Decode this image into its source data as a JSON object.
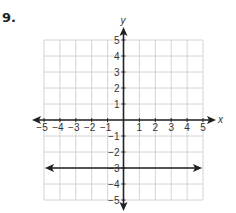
{
  "problem": {
    "number": "9."
  },
  "chart_data": {
    "type": "line",
    "title": "",
    "xlabel": "x",
    "ylabel": "y",
    "xlim": [
      -5,
      5
    ],
    "ylim": [
      -5,
      5
    ],
    "grid": true,
    "x_ticks": [
      "−5",
      "−4",
      "−3",
      "−2",
      "−1",
      "1",
      "2",
      "3",
      "4",
      "5"
    ],
    "y_ticks": [
      "5",
      "4",
      "3",
      "2",
      "1",
      "−1",
      "−2",
      "−3",
      "−4",
      "−5"
    ],
    "series": [
      {
        "name": "y = −3",
        "type": "horizontal-line",
        "y": -3,
        "x": [
          -5,
          5
        ],
        "values": [
          -3,
          -3
        ],
        "arrows": "both"
      }
    ]
  },
  "colors": {
    "grid": "#d4d4d4",
    "axis": "#222222",
    "line": "#222222",
    "text": "#333333"
  }
}
